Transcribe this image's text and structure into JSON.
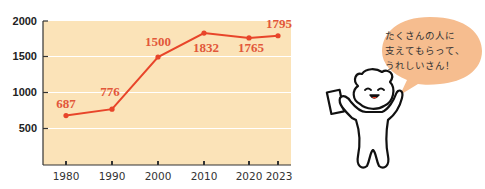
{
  "chart_data": {
    "type": "line",
    "title": "",
    "xlabel": "",
    "ylabel": "",
    "categories": [
      "1980",
      "1990",
      "2000",
      "2010",
      "2020",
      "2023"
    ],
    "series": [
      {
        "name": "",
        "values": [
          687,
          776,
          1500,
          1832,
          1765,
          1795
        ]
      }
    ],
    "value_labels": [
      "687",
      "776",
      "1500",
      "1832",
      "1765",
      "1795"
    ],
    "yticks": [
      "2000",
      "1500",
      "1000",
      "500"
    ],
    "ylim": [
      0,
      2000
    ],
    "grid": true,
    "legend": "none",
    "colors": {
      "line": "#e8452a",
      "background": "#fbe3b8",
      "grid": "#ffffff",
      "axis": "#333333"
    }
  },
  "character": {
    "speech_bubble_lines": [
      "たくさんの人に",
      "支えてもらって、",
      "うれしいさん！"
    ],
    "bubble_color": "#f6bd8f"
  }
}
